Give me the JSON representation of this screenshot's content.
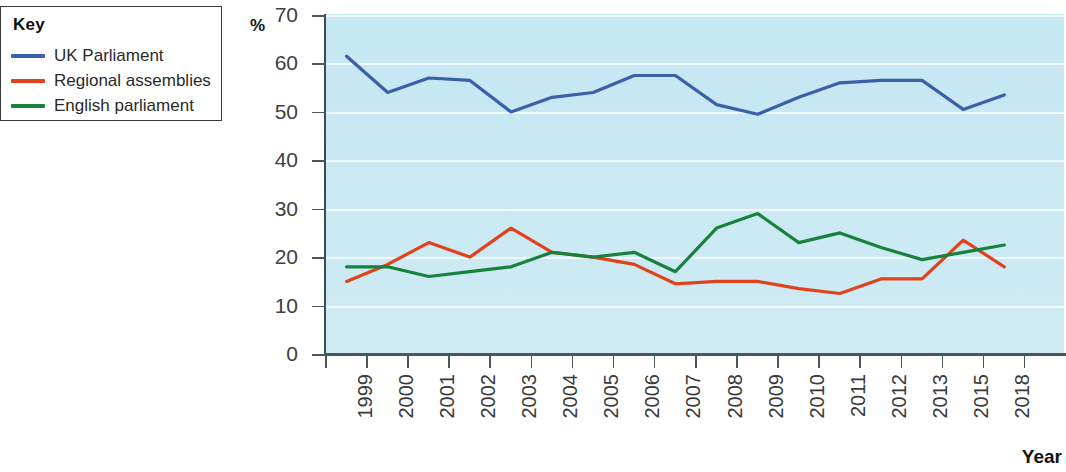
{
  "legend": {
    "title": "Key",
    "items": [
      {
        "label": "UK Parliament",
        "color": "#3b5fa8"
      },
      {
        "label": "Regional assemblies",
        "color": "#e0431c"
      },
      {
        "label": "English parliament",
        "color": "#17823c"
      }
    ]
  },
  "axes": {
    "y_unit_label": "%",
    "x_title": "Year",
    "y_ticks": [
      0,
      10,
      20,
      30,
      40,
      50,
      60,
      70
    ],
    "ylim": [
      0,
      70
    ],
    "grid": true
  },
  "chart_data": {
    "type": "line",
    "title": "",
    "xlabel": "Year",
    "ylabel": "%",
    "ylim": [
      0,
      70
    ],
    "grid": true,
    "legend_position": "top-left-outside",
    "categories": [
      "1999",
      "2000",
      "2001",
      "2002",
      "2003",
      "2004",
      "2005",
      "2006",
      "2007",
      "2008",
      "2009",
      "2010",
      "2011",
      "2012",
      "2013",
      "2015",
      "2018"
    ],
    "series": [
      {
        "name": "UK Parliament",
        "color": "#3b5fa8",
        "values": [
          61.5,
          54.0,
          57.0,
          56.5,
          50.0,
          53.0,
          54.0,
          57.5,
          57.5,
          51.5,
          49.5,
          53.0,
          56.0,
          56.5,
          56.5,
          50.5,
          53.5
        ]
      },
      {
        "name": "Regional assemblies",
        "color": "#e0431c",
        "values": [
          15.0,
          18.5,
          23.0,
          20.0,
          26.0,
          21.0,
          20.0,
          18.5,
          14.5,
          15.0,
          15.0,
          13.5,
          12.5,
          15.5,
          15.5,
          23.5,
          18.0
        ]
      },
      {
        "name": "English parliament",
        "color": "#17823c",
        "values": [
          18.0,
          18.0,
          16.0,
          17.0,
          18.0,
          21.0,
          20.0,
          21.0,
          17.0,
          26.0,
          29.0,
          23.0,
          25.0,
          22.0,
          19.5,
          21.0,
          22.5
        ]
      }
    ]
  }
}
